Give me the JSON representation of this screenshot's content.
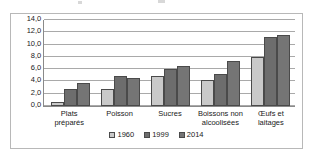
{
  "chart_data": {
    "type": "bar",
    "title": "",
    "subtitle": "",
    "xlabel": "",
    "ylabel": "",
    "categories": [
      "Plats préparés",
      "Poisson",
      "Sucres",
      "Boissons non alcoolisées",
      "Œufs et laitages"
    ],
    "category_lines": [
      [
        "Plats",
        "préparés"
      ],
      [
        "Poisson"
      ],
      [
        "Sucres"
      ],
      [
        "Boissons non",
        "alcoolisées"
      ],
      [
        "Œufs et",
        "laitages"
      ]
    ],
    "series": [
      {
        "name": "1960",
        "color": "#c9c9c9",
        "values": [
          0.7,
          2.7,
          4.9,
          4.3,
          7.9
        ]
      },
      {
        "name": "1999",
        "color": "#6d6d6d",
        "values": [
          2.7,
          4.9,
          6.0,
          5.2,
          11.2
        ]
      },
      {
        "name": "2014",
        "color": "#757575",
        "values": [
          3.8,
          4.6,
          6.5,
          7.3,
          11.6
        ]
      }
    ],
    "ylim": [
      0.0,
      14.0
    ],
    "ytick_values": [
      0.0,
      2.0,
      4.0,
      6.0,
      8.0,
      10.0,
      12.0,
      14.0
    ],
    "ytick_labels": [
      "0,0",
      "2,0",
      "4,0",
      "6,0",
      "8,0",
      "10,0",
      "12,0",
      "14,0"
    ],
    "grid": true,
    "grid_axis": "y",
    "legend_position": "bottom",
    "legend_entries": [
      "1960",
      "1999",
      "2014"
    ]
  }
}
